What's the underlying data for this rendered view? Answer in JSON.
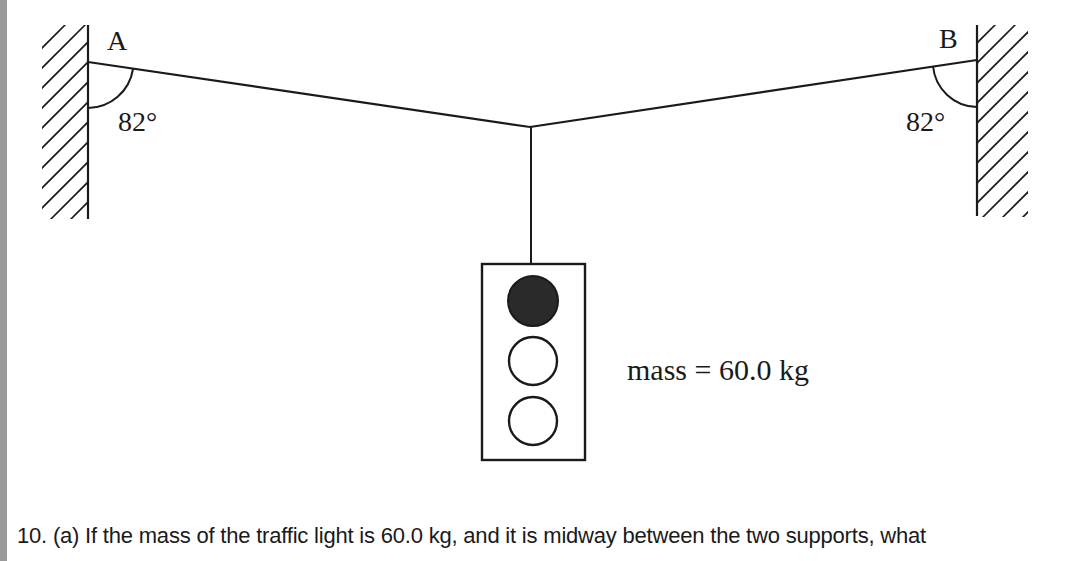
{
  "diagram": {
    "support_a": {
      "label": "A",
      "angle_label": "82°"
    },
    "support_b": {
      "label": "B",
      "angle_label": "82°"
    },
    "traffic_light": {
      "lights": [
        "filled",
        "empty",
        "empty"
      ]
    },
    "mass_label": "mass = 60.0 kg"
  },
  "question": {
    "text": "10. (a) If the mass of the traffic light is 60.0 kg, and it is midway between the two supports, what"
  },
  "colors": {
    "ink": "#1a1a1a",
    "border_strip": "#9a9a9a",
    "background": "#ffffff"
  }
}
